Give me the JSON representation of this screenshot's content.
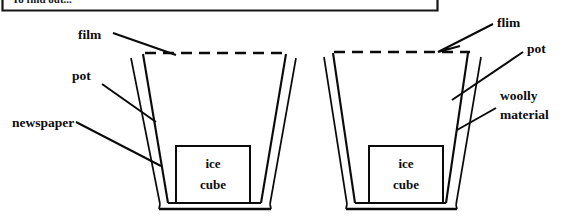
{
  "figure": {
    "caption_box": {
      "text": "To find out...",
      "note": "clipped at top edge of image"
    },
    "pots": [
      {
        "id": "left-pot",
        "name": "pot-insulated-with-newspaper",
        "ice_label_line1": "ice",
        "ice_label_line2": "cube",
        "labels": [
          {
            "key": "film",
            "text": "film"
          },
          {
            "key": "pot",
            "text": "pot"
          },
          {
            "key": "newspaper",
            "text": "newspaper"
          }
        ]
      },
      {
        "id": "right-pot",
        "name": "pot-insulated-with-woolly-material",
        "ice_label_line1": "ice",
        "ice_label_line2": "cube",
        "labels": [
          {
            "key": "flim",
            "text": "flim"
          },
          {
            "key": "pot",
            "text": "pot"
          },
          {
            "key": "woolly_line1",
            "text": "woolly"
          },
          {
            "key": "woolly_line2",
            "text": "material"
          }
        ]
      }
    ],
    "colors": {
      "ink": "#0a0a0a",
      "paper": "#ffffff"
    }
  }
}
